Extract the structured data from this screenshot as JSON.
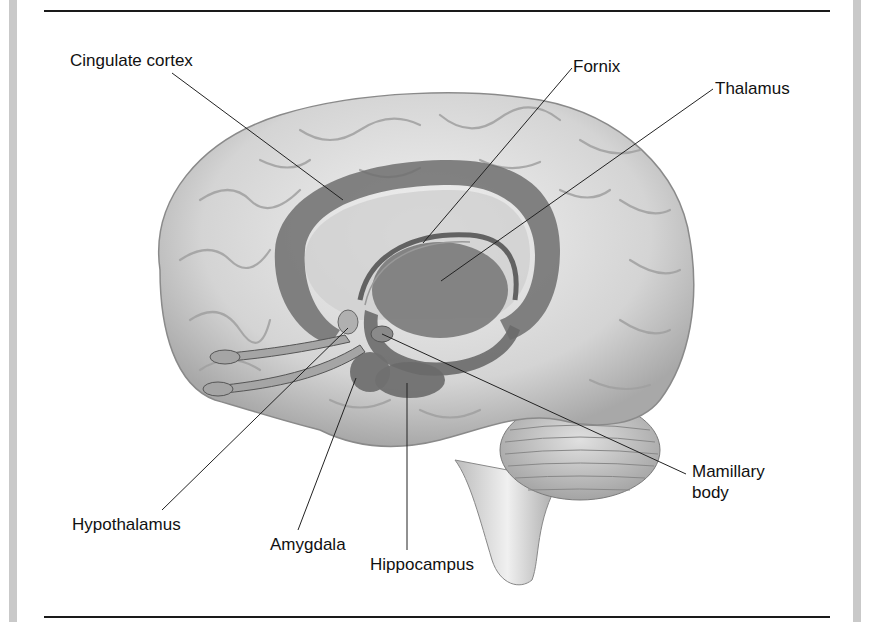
{
  "figure": {
    "type": "anatomical-diagram",
    "labels": [
      {
        "id": "cingulate-cortex",
        "text": "Cingulate cortex"
      },
      {
        "id": "fornix",
        "text": "Fornix"
      },
      {
        "id": "thalamus",
        "text": "Thalamus"
      },
      {
        "id": "mamillary-body",
        "text": "Mamillary\nbody",
        "line1": "Mamillary",
        "line2": "body"
      },
      {
        "id": "hypothalamus",
        "text": "Hypothalamus"
      },
      {
        "id": "amygdala",
        "text": "Amygdala"
      },
      {
        "id": "hippocampus",
        "text": "Hippocampus"
      }
    ]
  },
  "colors": {
    "background": "#ffffff",
    "side_bar": "#c9c9c9",
    "rule": "#1a1a1a",
    "brain_light": "#e8e8e8",
    "brain_mid": "#bdbdbd",
    "limbic_dark": "#6e6e6e",
    "text": "#111111"
  }
}
